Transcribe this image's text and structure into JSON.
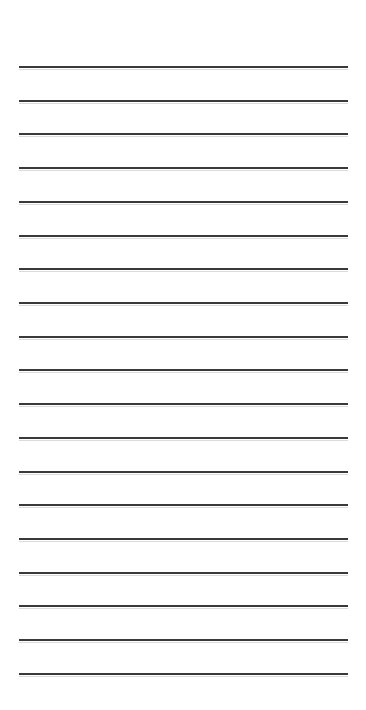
{
  "document": {
    "kind": "lined-paper",
    "title": "Ruled Lined Paper",
    "background_color": "#ffffff",
    "canvas": {
      "width": 366,
      "height": 710
    }
  },
  "ruling": {
    "line_color": "#3a3a3c",
    "line_thickness": 2,
    "line_count": 19,
    "line_left": 19,
    "line_right": 348,
    "line_width": 329,
    "first_line_y": 66,
    "line_spacing": 33.7,
    "top_margin": 66,
    "bottom_margin": 37,
    "left_margin": 19,
    "right_margin": 18,
    "lines": [
      {
        "index": 1,
        "y": 66
      },
      {
        "index": 2,
        "y": 100
      },
      {
        "index": 3,
        "y": 133
      },
      {
        "index": 4,
        "y": 167
      },
      {
        "index": 5,
        "y": 201
      },
      {
        "index": 6,
        "y": 235
      },
      {
        "index": 7,
        "y": 268
      },
      {
        "index": 8,
        "y": 302
      },
      {
        "index": 9,
        "y": 336
      },
      {
        "index": 10,
        "y": 369
      },
      {
        "index": 11,
        "y": 403
      },
      {
        "index": 12,
        "y": 437
      },
      {
        "index": 13,
        "y": 471
      },
      {
        "index": 14,
        "y": 504
      },
      {
        "index": 15,
        "y": 538
      },
      {
        "index": 16,
        "y": 572
      },
      {
        "index": 17,
        "y": 605
      },
      {
        "index": 18,
        "y": 639
      },
      {
        "index": 19,
        "y": 673
      }
    ]
  },
  "content": {
    "written_text": "",
    "note": ""
  }
}
